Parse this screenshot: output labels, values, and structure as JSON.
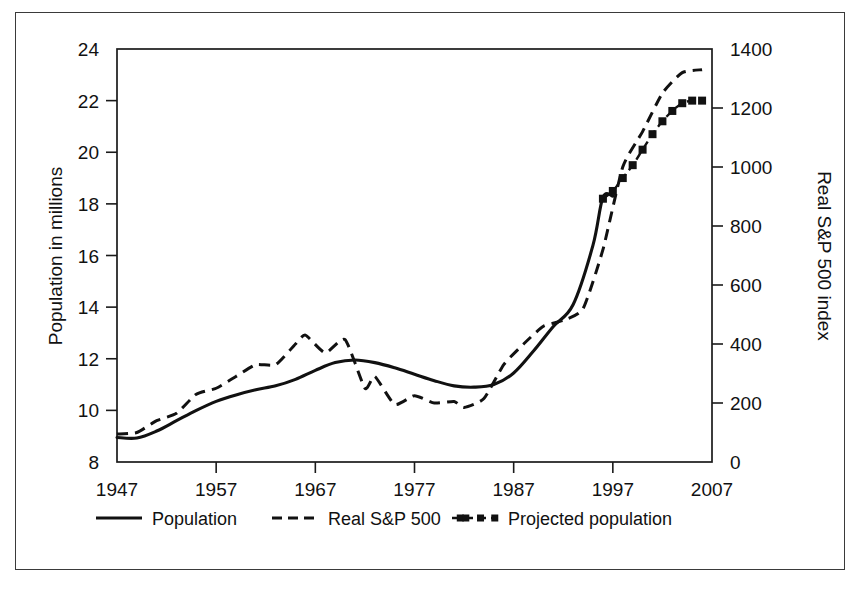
{
  "chart_data": {
    "type": "line",
    "title": "",
    "xlabel": "",
    "ylabel": "Population in millions",
    "y2label": "Real S&P 500 index",
    "grid": false,
    "legend_position": "bottom",
    "xlim": [
      1947,
      2007
    ],
    "ylim": [
      8,
      24
    ],
    "y2lim": [
      0,
      1400
    ],
    "x_ticks": [
      "1947",
      "1957",
      "1967",
      "1977",
      "1987",
      "1997",
      "2007"
    ],
    "x_tick_values": [
      1947,
      1957,
      1967,
      1977,
      1987,
      1997,
      2007
    ],
    "y_ticks": [
      "8",
      "10",
      "12",
      "14",
      "16",
      "18",
      "20",
      "22",
      "24"
    ],
    "y_tick_values": [
      8,
      10,
      12,
      14,
      16,
      18,
      20,
      22,
      24
    ],
    "y2_ticks": [
      "0",
      "200",
      "400",
      "600",
      "800",
      "1000",
      "1200",
      "1400"
    ],
    "y2_tick_values": [
      0,
      200,
      400,
      600,
      800,
      1000,
      1200,
      1400
    ],
    "series": [
      {
        "name": "Population",
        "axis": "left",
        "style": "solid",
        "marker": "none",
        "color": "#111111",
        "x": [
          1947,
          1949,
          1951,
          1953,
          1955,
          1957,
          1959,
          1961,
          1963,
          1965,
          1967,
          1969,
          1971,
          1973,
          1975,
          1977,
          1979,
          1981,
          1983,
          1985,
          1987,
          1989,
          1991,
          1993,
          1995,
          1996,
          1997
        ],
        "values": [
          8.95,
          8.93,
          9.2,
          9.6,
          10.0,
          10.35,
          10.6,
          10.8,
          10.95,
          11.2,
          11.55,
          11.85,
          11.95,
          11.85,
          11.65,
          11.4,
          11.15,
          10.95,
          10.9,
          11.0,
          11.45,
          12.3,
          13.25,
          14.1,
          16.4,
          18.25,
          18.3
        ]
      },
      {
        "name": "Real S&P 500",
        "axis": "right",
        "style": "dashed",
        "marker": "none",
        "color": "#111111",
        "x": [
          1947,
          1949,
          1951,
          1953,
          1955,
          1957,
          1959,
          1961,
          1963,
          1965,
          1966,
          1968,
          1970,
          1972,
          1973,
          1975,
          1977,
          1979,
          1981,
          1982,
          1984,
          1986,
          1988,
          1990,
          1992,
          1994,
          1996,
          1998,
          2000,
          2002,
          2004,
          2006
        ],
        "values": [
          95,
          100,
          140,
          165,
          230,
          250,
          290,
          330,
          330,
          400,
          430,
          370,
          415,
          250,
          290,
          195,
          225,
          200,
          205,
          185,
          215,
          330,
          400,
          460,
          480,
          520,
          720,
          1000,
          1120,
          1250,
          1320,
          1330
        ]
      },
      {
        "name": "Projected population",
        "axis": "left",
        "style": "dashed-marker",
        "marker": "square",
        "color": "#111111",
        "x": [
          1996,
          1997,
          1998,
          1999,
          2000,
          2001,
          2002,
          2003,
          2004,
          2005,
          2006
        ],
        "values": [
          18.2,
          18.5,
          19.0,
          19.5,
          20.1,
          20.7,
          21.2,
          21.6,
          21.9,
          22.0,
          22.0
        ]
      }
    ],
    "legend": [
      {
        "label": "Population",
        "style": "solid",
        "marker": "none"
      },
      {
        "label": "Real S&P 500",
        "style": "dashed",
        "marker": "none"
      },
      {
        "label": "Projected population",
        "style": "dashed-marker",
        "marker": "square"
      }
    ]
  }
}
